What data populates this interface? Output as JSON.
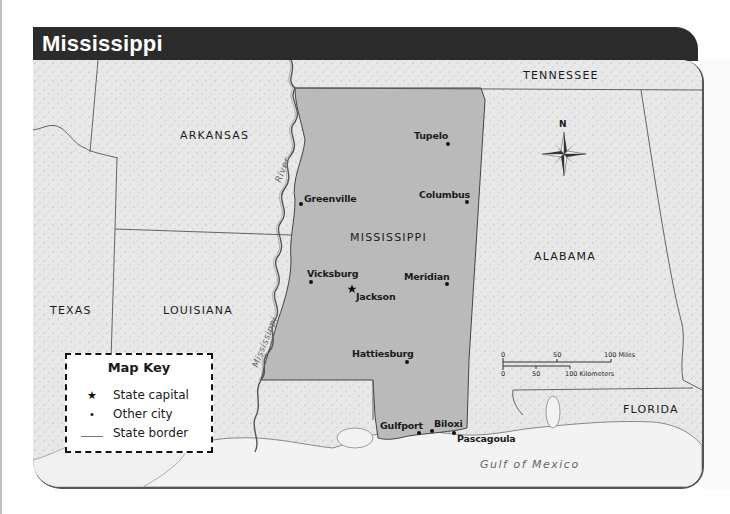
{
  "title": "Mississippi",
  "states": {
    "focus": "MISSISSIPPI",
    "neighbors": [
      "TENNESSEE",
      "ARKANSAS",
      "ALABAMA",
      "LOUISIANA",
      "TEXAS",
      "FLORIDA"
    ]
  },
  "labels": {
    "tennessee": "TENNESSEE",
    "arkansas": "ARKANSAS",
    "mississippi": "MISSISSIPPI",
    "alabama": "ALABAMA",
    "louisiana": "LOUISIANA",
    "texas": "TEXAS",
    "florida": "FLORIDA",
    "gulf": "Gulf of Mexico",
    "river_word1": "Mississippi",
    "river_word2": "River"
  },
  "cities": {
    "tupelo": "Tupelo",
    "greenville": "Greenville",
    "columbus": "Columbus",
    "vicksburg": "Vicksburg",
    "jackson": "Jackson",
    "meridian": "Meridian",
    "hattiesburg": "Hattiesburg",
    "gulfport": "Gulfport",
    "biloxi": "Biloxi",
    "pascagoula": "Pascagoula"
  },
  "capital": "Jackson",
  "compass": {
    "north_label": "N"
  },
  "scale_bar": {
    "miles": {
      "ticks": [
        "0",
        "50",
        "100 Miles"
      ]
    },
    "kilometers": {
      "ticks": [
        "0",
        "50",
        "100 Kilometers"
      ]
    }
  },
  "map_key": {
    "title": "Map Key",
    "items": [
      {
        "symbol": "★",
        "label": "State capital"
      },
      {
        "symbol": "•",
        "label": "Other city"
      },
      {
        "symbol": "line",
        "label": "State border"
      }
    ]
  },
  "colors": {
    "title_bar": "#2b2b2b",
    "focus_state": "#b8b8b8",
    "land": "#e6e6e6",
    "water": "#f2f2f2",
    "border": "#555555"
  }
}
